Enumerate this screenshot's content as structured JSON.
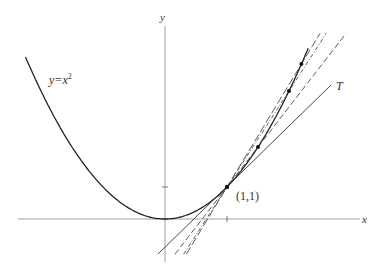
{
  "diagram": {
    "curve_label": {
      "prefix": "y=x",
      "exponent": "2"
    },
    "axis_x_label": "x",
    "axis_y_label": "y",
    "point_label": "(1,1)",
    "tangent_label": "T",
    "point": [
      1,
      1
    ],
    "tangent_slope": 2,
    "secant_points_x": [
      1.5,
      2,
      2.2
    ],
    "colors": {
      "ink": "#222222",
      "axis": "#777777"
    }
  }
}
